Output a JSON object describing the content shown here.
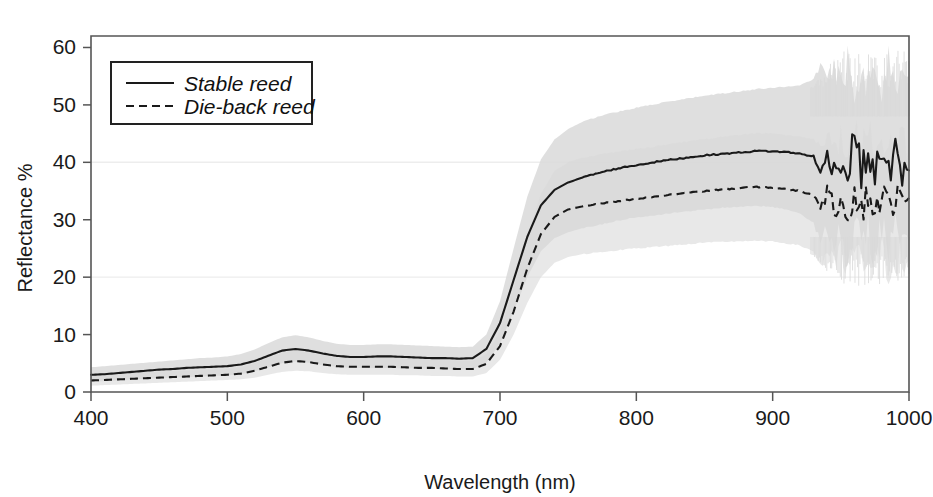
{
  "chart_data": {
    "type": "line",
    "title": "",
    "xlabel": "Wavelength (nm)",
    "ylabel": "Reflectance %",
    "xlim": [
      400,
      1000
    ],
    "ylim": [
      0,
      62
    ],
    "xticks": [
      400,
      500,
      600,
      700,
      800,
      900,
      1000
    ],
    "yticks": [
      0,
      10,
      20,
      30,
      40,
      50,
      60
    ],
    "grid": "horizontal gridlines at 20 and 40, very faint",
    "legend_position": "upper left inside axes",
    "shaded_band": "grey variability envelope (mean +/- sd) around each series",
    "band_color": "#d9d9d9",
    "series": [
      {
        "name": "Stable reed",
        "style": "solid",
        "color": "#1a1a1a",
        "x": [
          400,
          410,
          420,
          430,
          440,
          450,
          460,
          470,
          480,
          490,
          500,
          510,
          520,
          530,
          540,
          550,
          560,
          570,
          580,
          590,
          600,
          610,
          620,
          630,
          640,
          650,
          660,
          670,
          680,
          690,
          700,
          710,
          720,
          730,
          740,
          750,
          760,
          770,
          780,
          790,
          800,
          810,
          820,
          830,
          840,
          850,
          860,
          870,
          880,
          890,
          900,
          910,
          920,
          930,
          935,
          940,
          945,
          950,
          955,
          960,
          965,
          970,
          975,
          980,
          985,
          990,
          995,
          1000
        ],
        "values": [
          3.0,
          3.1,
          3.3,
          3.5,
          3.7,
          3.9,
          4.0,
          4.2,
          4.3,
          4.4,
          4.5,
          4.8,
          5.4,
          6.3,
          7.2,
          7.5,
          7.2,
          6.7,
          6.3,
          6.1,
          6.1,
          6.2,
          6.2,
          6.1,
          6.0,
          5.9,
          5.9,
          5.8,
          5.9,
          7.5,
          12.0,
          19.5,
          27.0,
          32.5,
          35.2,
          36.5,
          37.3,
          38.0,
          38.6,
          39.1,
          39.5,
          39.9,
          40.3,
          40.6,
          40.9,
          41.2,
          41.4,
          41.6,
          41.8,
          42.0,
          41.9,
          41.8,
          41.5,
          41.0,
          37.8,
          41.8,
          38.5,
          40.6,
          36.9,
          45.8,
          38.2,
          41.5,
          37.4,
          42.8,
          38.0,
          41.9,
          37.2,
          38.6
        ],
        "band_lower": [
          1.8,
          1.9,
          2.0,
          2.2,
          2.3,
          2.4,
          2.5,
          2.6,
          2.7,
          2.8,
          2.9,
          3.1,
          3.6,
          4.3,
          5.0,
          5.3,
          5.1,
          4.7,
          4.4,
          4.2,
          4.2,
          4.2,
          4.2,
          4.1,
          4.1,
          4.0,
          4.0,
          3.9,
          4.0,
          5.1,
          8.4,
          14.0,
          20.0,
          24.5,
          26.8,
          27.8,
          28.5,
          29.0,
          29.5,
          30.0,
          30.4,
          30.7,
          31.0,
          31.3,
          31.5,
          31.8,
          32.0,
          32.2,
          32.3,
          32.4,
          32.2,
          31.8,
          31.0,
          29.5,
          26.0,
          29.0,
          25.0,
          28.0,
          24.0,
          30.0,
          24.5,
          28.5,
          24.0,
          29.0,
          24.5,
          28.5,
          24.0,
          26.0
        ],
        "band_upper": [
          4.3,
          4.5,
          4.7,
          4.9,
          5.1,
          5.3,
          5.5,
          5.7,
          5.9,
          6.0,
          6.2,
          6.6,
          7.4,
          8.5,
          9.5,
          9.9,
          9.5,
          8.9,
          8.4,
          8.2,
          8.2,
          8.3,
          8.3,
          8.2,
          8.1,
          8.0,
          7.9,
          7.8,
          7.9,
          10.0,
          15.8,
          25.0,
          34.0,
          40.5,
          44.0,
          45.8,
          47.0,
          47.8,
          48.5,
          49.0,
          49.5,
          50.0,
          50.4,
          50.8,
          51.2,
          51.6,
          51.9,
          52.2,
          52.5,
          52.8,
          53.0,
          53.2,
          53.4,
          54.5,
          57.0,
          53.5,
          57.5,
          54.0,
          57.8,
          53.0,
          57.2,
          53.5,
          57.5,
          53.0,
          57.0,
          53.2,
          57.4,
          55.0
        ]
      },
      {
        "name": "Die-back reed",
        "style": "dashed",
        "color": "#1a1a1a",
        "x": [
          400,
          410,
          420,
          430,
          440,
          450,
          460,
          470,
          480,
          490,
          500,
          510,
          520,
          530,
          540,
          550,
          560,
          570,
          580,
          590,
          600,
          610,
          620,
          630,
          640,
          650,
          660,
          670,
          680,
          690,
          700,
          710,
          720,
          730,
          740,
          750,
          760,
          770,
          780,
          790,
          800,
          810,
          820,
          830,
          840,
          850,
          860,
          870,
          880,
          890,
          900,
          910,
          920,
          930,
          935,
          940,
          945,
          950,
          955,
          960,
          965,
          970,
          975,
          980,
          985,
          990,
          995,
          1000
        ],
        "values": [
          2.0,
          2.1,
          2.2,
          2.3,
          2.4,
          2.5,
          2.6,
          2.7,
          2.8,
          2.9,
          3.0,
          3.2,
          3.7,
          4.4,
          5.1,
          5.4,
          5.2,
          4.8,
          4.5,
          4.4,
          4.4,
          4.4,
          4.4,
          4.3,
          4.2,
          4.2,
          4.1,
          4.0,
          4.0,
          4.9,
          8.0,
          14.0,
          21.5,
          27.5,
          30.5,
          31.8,
          32.3,
          32.7,
          33.0,
          33.3,
          33.6,
          33.9,
          34.2,
          34.5,
          34.8,
          35.0,
          35.2,
          35.4,
          35.6,
          35.7,
          35.6,
          35.3,
          35.0,
          34.3,
          32.6,
          34.6,
          32.0,
          33.8,
          31.5,
          34.5,
          32.0,
          34.2,
          31.8,
          34.4,
          32.2,
          34.3,
          32.5,
          33.8
        ],
        "band_lower": [
          1.1,
          1.2,
          1.3,
          1.4,
          1.5,
          1.6,
          1.7,
          1.8,
          1.9,
          2.0,
          2.1,
          2.2,
          2.5,
          3.0,
          3.5,
          3.7,
          3.6,
          3.3,
          3.1,
          3.0,
          3.0,
          3.0,
          3.0,
          2.9,
          2.9,
          2.8,
          2.8,
          2.7,
          2.7,
          3.3,
          5.6,
          10.0,
          15.5,
          20.0,
          22.5,
          23.5,
          24.0,
          24.3,
          24.5,
          24.8,
          25.0,
          25.2,
          25.4,
          25.6,
          25.8,
          26.0,
          26.1,
          26.2,
          26.3,
          26.3,
          26.2,
          25.9,
          25.5,
          24.5,
          22.0,
          24.5,
          21.5,
          23.8,
          21.0,
          24.3,
          21.5,
          24.0,
          21.2,
          24.2,
          21.8,
          24.0,
          22.0,
          23.0
        ],
        "band_upper": [
          3.0,
          3.1,
          3.2,
          3.3,
          3.4,
          3.5,
          3.6,
          3.7,
          3.8,
          3.9,
          4.0,
          4.3,
          5.0,
          5.9,
          6.8,
          7.2,
          6.9,
          6.4,
          6.0,
          5.9,
          5.9,
          5.9,
          5.9,
          5.8,
          5.7,
          5.6,
          5.5,
          5.4,
          5.4,
          6.6,
          10.5,
          18.0,
          27.0,
          34.5,
          38.5,
          40.0,
          40.8,
          41.2,
          41.6,
          42.0,
          42.3,
          42.6,
          43.0,
          43.4,
          43.7,
          44.0,
          44.3,
          44.6,
          44.9,
          45.1,
          45.0,
          44.7,
          44.5,
          44.0,
          43.2,
          44.7,
          42.5,
          43.8,
          42.0,
          44.7,
          42.5,
          44.4,
          42.4,
          44.6,
          42.6,
          44.6,
          43.0,
          44.0
        ]
      }
    ]
  },
  "axes": {
    "x_title": "Wavelength (nm)",
    "y_title": "Reflectance %",
    "x_tick_labels": [
      "400",
      "500",
      "600",
      "700",
      "800",
      "900",
      "1000"
    ],
    "y_tick_labels": [
      "0",
      "10",
      "20",
      "30",
      "40",
      "50",
      "60"
    ]
  },
  "legend": {
    "entries": [
      {
        "label": "Stable reed",
        "style": "solid"
      },
      {
        "label": "Die-back reed",
        "style": "dashed"
      }
    ]
  },
  "colors": {
    "line": "#1a1a1a",
    "band": "#d9d9d9",
    "frame": "#555555",
    "grid": "#ededed",
    "background": "#ffffff"
  }
}
